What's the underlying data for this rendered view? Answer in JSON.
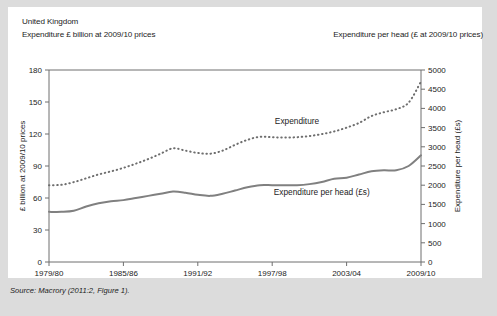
{
  "figure": {
    "background_color": "#dcdcdc",
    "card_color": "#ffffff",
    "source_note": "Source: Macrory (2011:2, Figure 1)."
  },
  "header": {
    "country": "United Kingdom",
    "left_axis_caption": "Expenditure £  billion at 2009/10 prices",
    "right_axis_caption": "Expenditure per head (£ at 2009/10 prices)"
  },
  "chart_data": {
    "type": "line",
    "title": "United Kingdom",
    "xlabel": "",
    "ylabel": "£ billion at 2009/10 prices",
    "y2label": "Expenditure per head (£s)",
    "grid": false,
    "legend_position": "inline-annotations",
    "ylim": [
      0,
      180
    ],
    "y2lim": [
      0,
      5000
    ],
    "yticks": [
      0,
      30,
      60,
      90,
      120,
      150,
      180
    ],
    "y2ticks": [
      0,
      500,
      1000,
      1500,
      2000,
      2500,
      3000,
      3500,
      4000,
      4500,
      5000
    ],
    "xtick_labels": [
      "1979/80",
      "1985/86",
      "1991/92",
      "1997/98",
      "2003/04",
      "2009/10"
    ],
    "xtick_years": [
      1979,
      1985,
      1991,
      1997,
      2003,
      2009
    ],
    "x": [
      1979,
      1980,
      1981,
      1982,
      1983,
      1984,
      1985,
      1986,
      1987,
      1988,
      1989,
      1990,
      1991,
      1992,
      1993,
      1994,
      1995,
      1996,
      1997,
      1998,
      1999,
      2000,
      2001,
      2002,
      2003,
      2004,
      2005,
      2006,
      2007,
      2008,
      2009
    ],
    "series": [
      {
        "name": "Expenditure",
        "axis": "right",
        "units": "£ per head at 2009/10 prices",
        "style": "dotted",
        "color": "#6e6e6e",
        "annotation_label": "Expenditure",
        "values": [
          2000,
          2010,
          2080,
          2180,
          2280,
          2360,
          2450,
          2560,
          2680,
          2820,
          2960,
          2900,
          2840,
          2820,
          2900,
          3050,
          3180,
          3260,
          3250,
          3240,
          3250,
          3280,
          3330,
          3400,
          3500,
          3620,
          3800,
          3900,
          3980,
          4150,
          4700
        ]
      },
      {
        "name": "Expenditure per head (£s)",
        "axis": "left",
        "units": "£ billion at 2009/10 prices",
        "style": "solid",
        "color": "#808080",
        "annotation_label": "Expenditure per head (£s)",
        "values": [
          47,
          47,
          48,
          52,
          55,
          57,
          58,
          60,
          62,
          64,
          66,
          65,
          63,
          62,
          64,
          67,
          70,
          72,
          72,
          72,
          72,
          73,
          75,
          78,
          79,
          82,
          85,
          86,
          86,
          90,
          100
        ]
      }
    ],
    "annotations": [
      {
        "text": "Expenditure",
        "x_year": 1999,
        "y_value": 3600
      },
      {
        "text": "Expenditure per head (£s)",
        "x_year": 2001,
        "y_value": 63
      }
    ]
  }
}
